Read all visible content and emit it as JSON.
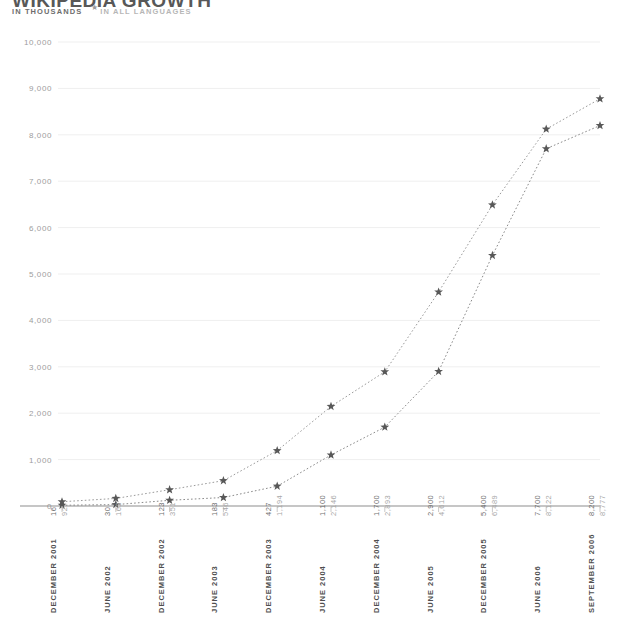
{
  "header": {
    "title": "WIKIPEDIA GROWTH",
    "subtitle_units": "IN THOUSANDS",
    "subtitle_star": "★",
    "subtitle_note": "IN ALL LANGUAGES"
  },
  "chart_data": {
    "type": "line",
    "title": "WIKIPEDIA GROWTH",
    "subtitle": "IN THOUSANDS ★ IN ALL LANGUAGES",
    "xlabel": "",
    "ylabel": "",
    "ylim": [
      0,
      10000
    ],
    "ytick_step": 1000,
    "grid": true,
    "legend": "none",
    "marker": "star",
    "linestyle": "dotted",
    "categories": [
      "DECEMBER 2001",
      "JUNE 2002",
      "DECEMBER 2002",
      "JUNE 2003",
      "DECEMBER 2003",
      "JUNE 2004",
      "DECEMBER 2004",
      "JUNE 2005",
      "DECEMBER 2005",
      "JUNE 2006",
      "SEPTEMBER 2006"
    ],
    "ytick_labels": [
      "0",
      "1,000",
      "2,000",
      "3,000",
      "4,000",
      "5,000",
      "6,000",
      "7,000",
      "8,000",
      "9,000",
      "10,000"
    ],
    "ytick_values": [
      0,
      1000,
      2000,
      3000,
      4000,
      5000,
      6000,
      7000,
      8000,
      9000,
      10000
    ],
    "series": [
      {
        "name": "series-a",
        "color": "#6f6f6f",
        "values": [
          16,
          30,
          123,
          183,
          427,
          1100,
          1700,
          2900,
          5400,
          7700,
          8200
        ],
        "labels": [
          "16",
          "30",
          "123",
          "183",
          "427",
          "1,100",
          "1,700",
          "2,900",
          "5,400",
          "7,700",
          "8,200"
        ]
      },
      {
        "name": "series-b",
        "color": "#a8a8a8",
        "values": [
          92,
          163,
          351,
          546,
          1194,
          2146,
          2893,
          4612,
          6489,
          8122,
          8777
        ],
        "labels": [
          "92",
          "163",
          "351",
          "546",
          "1,194",
          "2,146",
          "2,893",
          "4,612",
          "6,489",
          "8,122",
          "8,777"
        ]
      }
    ]
  }
}
